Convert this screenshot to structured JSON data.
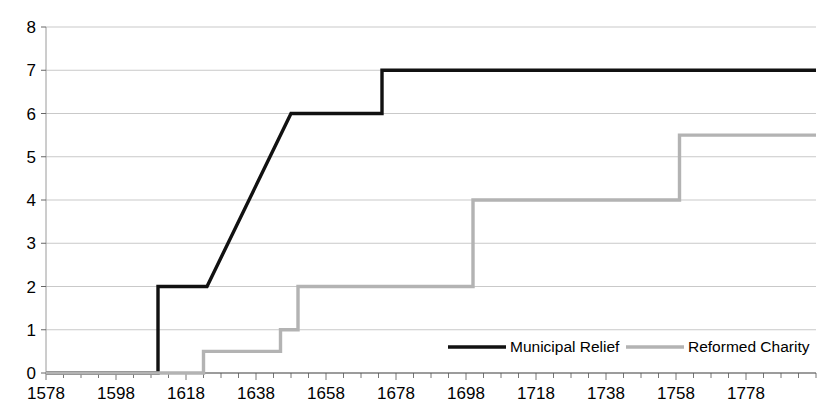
{
  "chart_data": {
    "type": "line",
    "title": "",
    "subtitle": "",
    "xlabel": "",
    "ylabel": "",
    "xlim": [
      1578,
      1798
    ],
    "ylim": [
      0,
      8
    ],
    "grid": true,
    "legend_position": "bottom-right",
    "x_ticks": [
      1578,
      1598,
      1618,
      1638,
      1658,
      1678,
      1698,
      1718,
      1738,
      1758,
      1778
    ],
    "x_tick_labels": [
      "1578",
      "1598",
      "1618",
      "1638",
      "1658",
      "1678",
      "1698",
      "1718",
      "1738",
      "1758",
      "1778"
    ],
    "x_minor_tick_interval": 5,
    "y_ticks": [
      0,
      1,
      2,
      3,
      4,
      5,
      6,
      7,
      8
    ],
    "y_tick_labels": [
      "0",
      "1",
      "2",
      "3",
      "4",
      "5",
      "6",
      "7",
      "8"
    ],
    "series": [
      {
        "name": "Municipal Relief",
        "color": "#111111",
        "width": 3.4,
        "points": [
          [
            1578,
            0
          ],
          [
            1610,
            0
          ],
          [
            1610,
            2
          ],
          [
            1624,
            2
          ],
          [
            1648,
            6
          ],
          [
            1674,
            6
          ],
          [
            1674,
            7
          ],
          [
            1798,
            7
          ]
        ]
      },
      {
        "name": "Reformed Charity",
        "color": "#b3b3b3",
        "width": 3.4,
        "points": [
          [
            1578,
            0
          ],
          [
            1623,
            0
          ],
          [
            1623,
            0.5
          ],
          [
            1645,
            0.5
          ],
          [
            1645,
            1
          ],
          [
            1650,
            1
          ],
          [
            1650,
            2
          ],
          [
            1700,
            2
          ],
          [
            1700,
            4
          ],
          [
            1759,
            4
          ],
          [
            1759,
            5.5
          ],
          [
            1798,
            5.5
          ]
        ]
      }
    ],
    "legend": [
      {
        "label": "Municipal Relief",
        "color": "#111111"
      },
      {
        "label": "Reformed Charity",
        "color": "#b3b3b3"
      }
    ]
  },
  "colors": {
    "municipal_relief": "#111111",
    "reformed_charity": "#b3b3b3",
    "grid": "#c9c9c9",
    "axis": "#9a9a9a",
    "background": "#ffffff"
  }
}
